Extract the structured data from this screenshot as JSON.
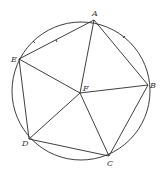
{
  "diagram": {
    "type": "inscribed-pentagon",
    "circle": {
      "cx": 81,
      "cy": 91,
      "r": 69
    },
    "points": {
      "A": {
        "label": "A",
        "x": 94,
        "y": 20,
        "lx": 92,
        "ly": 16
      },
      "B": {
        "label": "B",
        "x": 148,
        "y": 85,
        "lx": 150,
        "ly": 88
      },
      "C": {
        "label": "C",
        "x": 109,
        "y": 156,
        "lx": 108,
        "ly": 166
      },
      "D": {
        "label": "D",
        "x": 29,
        "y": 139,
        "lx": 22,
        "ly": 146
      },
      "E": {
        "label": "E",
        "x": 19,
        "y": 59,
        "lx": 12,
        "ly": 61
      },
      "F": {
        "label": "F",
        "x": 80,
        "y": 93,
        "lx": 83,
        "ly": 90
      }
    },
    "edges": [
      "AB",
      "BC",
      "CD",
      "DE",
      "EA",
      "FA",
      "FB",
      "FC",
      "FD",
      "FE"
    ],
    "tick_marks": [
      "arc EA",
      "chord EA"
    ]
  }
}
